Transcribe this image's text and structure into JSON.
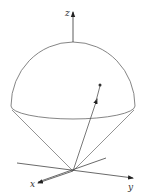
{
  "diagram": {
    "axes": {
      "z_label": "z",
      "x_label": "x",
      "y_label": "y"
    },
    "colors": {
      "stroke": "#555555",
      "axis": "#333333",
      "background": "#ffffff"
    },
    "elements": [
      "hemisphere-dome",
      "base-ellipse",
      "cone-lines",
      "position-vector",
      "point"
    ]
  }
}
